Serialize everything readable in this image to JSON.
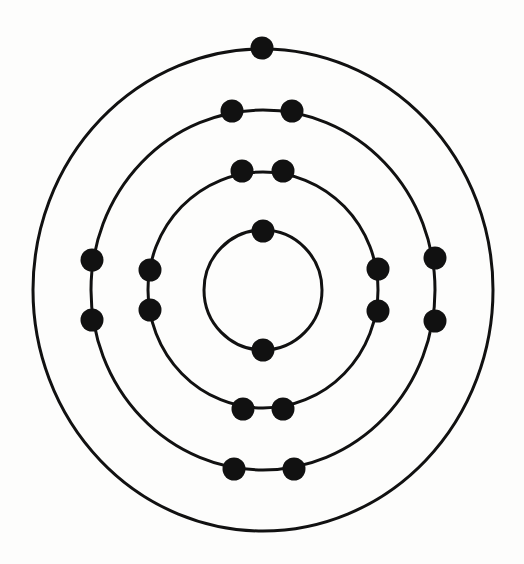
{
  "diagram": {
    "type": "bohr-atom-model",
    "title": "Bohr model electron shells",
    "center": {
      "x": 263,
      "y": 290
    },
    "stroke_color": "#111111",
    "electron_color": "#111111",
    "background_color": "#fdfdfc",
    "stroke_width": 3,
    "electron_radius": 11.5,
    "shells": [
      {
        "name": "shell-1",
        "rx": 59,
        "ry": 60,
        "electron_count": 2,
        "electrons": [
          {
            "x": 263,
            "y": 231
          },
          {
            "x": 263,
            "y": 350
          }
        ]
      },
      {
        "name": "shell-2",
        "rx": 115,
        "ry": 118,
        "electron_count": 8,
        "electrons": [
          {
            "x": 242,
            "y": 171
          },
          {
            "x": 283,
            "y": 171
          },
          {
            "x": 150,
            "y": 270
          },
          {
            "x": 150,
            "y": 310
          },
          {
            "x": 378,
            "y": 269
          },
          {
            "x": 378,
            "y": 311
          },
          {
            "x": 243,
            "y": 409
          },
          {
            "x": 283,
            "y": 409
          }
        ]
      },
      {
        "name": "shell-3",
        "rx": 172,
        "ry": 180,
        "electron_count": 8,
        "electrons": [
          {
            "x": 232,
            "y": 111
          },
          {
            "x": 292,
            "y": 111
          },
          {
            "x": 92,
            "y": 260
          },
          {
            "x": 92,
            "y": 320
          },
          {
            "x": 435,
            "y": 258
          },
          {
            "x": 435,
            "y": 321
          },
          {
            "x": 234,
            "y": 469
          },
          {
            "x": 294,
            "y": 469
          }
        ]
      },
      {
        "name": "shell-4",
        "rx": 230,
        "ry": 241,
        "electron_count": 1,
        "electrons": [
          {
            "x": 262,
            "y": 48
          }
        ]
      }
    ],
    "total_electrons": 19
  }
}
